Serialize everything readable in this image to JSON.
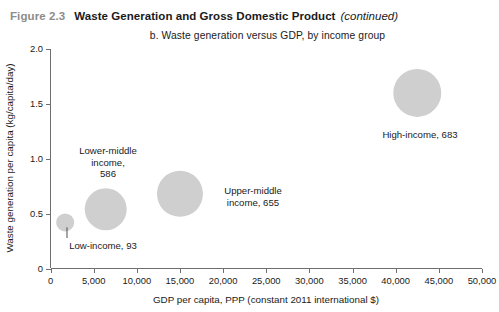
{
  "header": {
    "figure_number": "Figure 2.3",
    "title": "Waste Generation and Gross Domestic Product",
    "continued": "(continued)"
  },
  "panel": {
    "subtitle": "b. Waste generation versus GDP, by income group"
  },
  "colors": {
    "bubble_fill": "#cfcfcf",
    "axis": "#6f6f6f",
    "text": "#1a1a1a",
    "figure_number": "#8c8c8c",
    "leader": "#4d4d4d"
  },
  "chart_data": {
    "type": "scatter",
    "title": "b. Waste generation versus GDP, by income group",
    "xlabel": "GDP per capita, PPP (constant 2011 international $)",
    "ylabel": "Waste generation per capita (kg/capita/day)",
    "xlim": [
      0,
      50000
    ],
    "ylim": [
      0,
      2.0
    ],
    "xticks": [
      0,
      5000,
      10000,
      15000,
      20000,
      25000,
      30000,
      35000,
      40000,
      45000,
      50000
    ],
    "xtick_labels": [
      "0",
      "5,000",
      "10,000",
      "15,000",
      "20,000",
      "25,000",
      "30,000",
      "35,000",
      "40,000",
      "45,000",
      "50,000"
    ],
    "yticks": [
      0,
      0.5,
      1.0,
      1.5,
      2.0
    ],
    "ytick_labels": [
      "0",
      "0.5",
      "1.0",
      "1.5",
      "2.0"
    ],
    "grid": false,
    "legend": "none",
    "bubble_size_meaning": "waste generation total (millions of tonnes per year)",
    "points": [
      {
        "name": "Low-income",
        "label_lines": [
          "Low-income, 93"
        ],
        "x": 1700,
        "y": 0.42,
        "size": 93,
        "radius_px": 9,
        "label_x_px": 103,
        "label_y_px": 249,
        "label_anchor": "middle",
        "leader": true
      },
      {
        "name": "Lower-middle income",
        "label_lines": [
          "Lower-middle",
          "income,",
          "586"
        ],
        "x": 6400,
        "y": 0.54,
        "size": 586,
        "radius_px": 21,
        "label_x_px": 108,
        "label_y_px": 154,
        "label_anchor": "middle",
        "leader": false
      },
      {
        "name": "Upper-middle income",
        "label_lines": [
          "Upper-middle",
          "income, 655"
        ],
        "x": 15000,
        "y": 0.68,
        "size": 655,
        "radius_px": 23,
        "label_x_px": 253,
        "label_y_px": 194,
        "label_anchor": "middle",
        "leader": false
      },
      {
        "name": "High-income",
        "label_lines": [
          "High-income, 683"
        ],
        "x": 42500,
        "y": 1.6,
        "size": 683,
        "radius_px": 24,
        "label_x_px": 420,
        "label_y_px": 138,
        "label_anchor": "middle",
        "leader": false
      }
    ]
  }
}
